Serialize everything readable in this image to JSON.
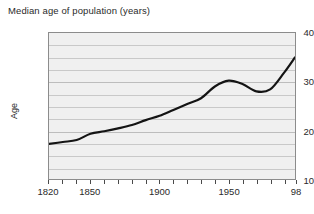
{
  "chart_data": {
    "type": "line",
    "title": "Median age of population (years)",
    "xlabel": "",
    "ylabel": "Age",
    "ylim": [
      10,
      40
    ],
    "xlim": [
      1820,
      1998
    ],
    "grid": true,
    "legend": "none",
    "y_ticks": [
      40,
      30,
      20,
      10
    ],
    "y_tick_labels": [
      "40",
      "30",
      "20",
      "10"
    ],
    "y_gridlines": [
      37.5,
      35,
      32.5,
      30,
      27.5,
      25,
      22.5,
      20,
      17.5,
      15,
      12.5
    ],
    "x_ticks": [
      1820,
      1830,
      1840,
      1850,
      1860,
      1870,
      1880,
      1890,
      1900,
      1910,
      1920,
      1930,
      1940,
      1950,
      1960,
      1970,
      1980,
      1990,
      1998
    ],
    "x_tick_labels": [
      "1820",
      "1850",
      "1900",
      "1950",
      "98"
    ],
    "x_labeled_ticks": [
      1820,
      1850,
      1900,
      1950,
      1998
    ],
    "series": [
      {
        "name": "Median age of population",
        "x": [
          1820,
          1830,
          1840,
          1850,
          1860,
          1870,
          1880,
          1890,
          1900,
          1910,
          1920,
          1930,
          1940,
          1950,
          1960,
          1970,
          1980,
          1990,
          1998
        ],
        "values": [
          17.2,
          17.6,
          18.0,
          19.3,
          19.8,
          20.4,
          21.1,
          22.1,
          23.0,
          24.2,
          25.4,
          26.6,
          29.0,
          30.2,
          29.5,
          28.0,
          28.4,
          31.8,
          35.0
        ]
      }
    ]
  },
  "axis": {
    "y_title": "Age"
  }
}
